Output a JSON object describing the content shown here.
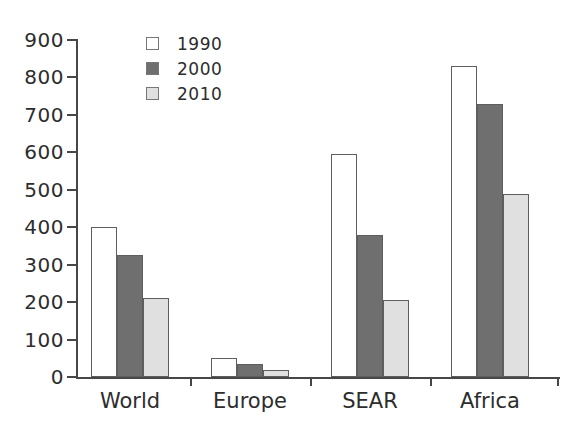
{
  "chart_data": {
    "type": "bar",
    "categories": [
      "World",
      "Europe",
      "SEAR",
      "Africa"
    ],
    "series": [
      {
        "name": "1990",
        "color": "#ffffff",
        "values": [
          400,
          50,
          595,
          830
        ]
      },
      {
        "name": "2000",
        "color": "#6f6f6f",
        "values": [
          325,
          35,
          380,
          730
        ]
      },
      {
        "name": "2010",
        "color": "#e0e0e0",
        "values": [
          210,
          20,
          205,
          490
        ]
      }
    ],
    "title": "",
    "xlabel": "",
    "ylabel": "",
    "ylim": [
      0,
      900
    ],
    "yticks": [
      0,
      100,
      200,
      300,
      400,
      500,
      600,
      700,
      800,
      900
    ],
    "grid": false,
    "legend_position": "top-left-inside",
    "colors": {
      "bar_outline": "#5e5e5e",
      "axis": "#474747",
      "text": "#2d2d2d",
      "background": "#ffffff"
    }
  }
}
